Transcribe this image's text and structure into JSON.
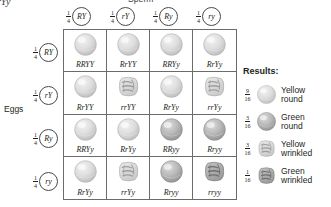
{
  "parent_genotype_clipped": "rYy",
  "labels": {
    "sperm": "Sperm",
    "eggs": "Eggs"
  },
  "fraction": {
    "numerator": "1",
    "denominator": "4"
  },
  "sperm_gametes": [
    {
      "allele": "RY"
    },
    {
      "allele": "rY"
    },
    {
      "allele": "Ry"
    },
    {
      "allele": "ry"
    }
  ],
  "egg_gametes": [
    {
      "allele": "RY"
    },
    {
      "allele": "rY"
    },
    {
      "allele": "Ry"
    },
    {
      "allele": "ry"
    }
  ],
  "grid": {
    "cells": [
      {
        "genotype": "RRYY",
        "shape": "round",
        "color": "yellow"
      },
      {
        "genotype": "RrYY",
        "shape": "round",
        "color": "yellow"
      },
      {
        "genotype": "RRYy",
        "shape": "round",
        "color": "yellow"
      },
      {
        "genotype": "RrYy",
        "shape": "round",
        "color": "yellow"
      },
      {
        "genotype": "RrYY",
        "shape": "round",
        "color": "yellow"
      },
      {
        "genotype": "rrYY",
        "shape": "wrinkled",
        "color": "yellow"
      },
      {
        "genotype": "RrYy",
        "shape": "round",
        "color": "yellow"
      },
      {
        "genotype": "rrYy",
        "shape": "wrinkled",
        "color": "yellow"
      },
      {
        "genotype": "RRYy",
        "shape": "round",
        "color": "yellow"
      },
      {
        "genotype": "RrYy",
        "shape": "round",
        "color": "yellow"
      },
      {
        "genotype": "RRyy",
        "shape": "round",
        "color": "green"
      },
      {
        "genotype": "Rryy",
        "shape": "round",
        "color": "green"
      },
      {
        "genotype": "RrYy",
        "shape": "round",
        "color": "yellow"
      },
      {
        "genotype": "rrYy",
        "shape": "wrinkled",
        "color": "yellow"
      },
      {
        "genotype": "Rryy",
        "shape": "round",
        "color": "green"
      },
      {
        "genotype": "rryy",
        "shape": "wrinkled",
        "color": "green"
      }
    ]
  },
  "results": {
    "title": "Results:",
    "items": [
      {
        "numerator": "9",
        "denominator": "16",
        "line1": "Yellow",
        "line2": "round",
        "shape": "round",
        "color": "yellow"
      },
      {
        "numerator": "3",
        "denominator": "16",
        "line1": "Green",
        "line2": "round",
        "shape": "round",
        "color": "green"
      },
      {
        "numerator": "3",
        "denominator": "16",
        "line1": "Yellow",
        "line2": "wrinkled",
        "shape": "wrinkled",
        "color": "yellow"
      },
      {
        "numerator": "1",
        "denominator": "16",
        "line1": "Green",
        "line2": "wrinkled",
        "shape": "wrinkled",
        "color": "green"
      }
    ]
  },
  "colors": {
    "grid_line": "#6b6b6b",
    "text": "#231f20",
    "pea_yellow": "#dcdcdc",
    "pea_green": "#b4b4b4"
  }
}
